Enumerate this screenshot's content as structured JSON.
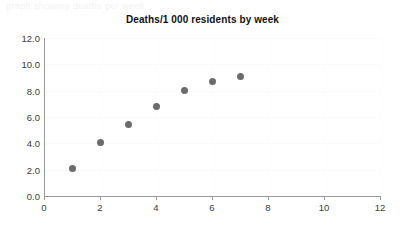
{
  "top_strip": {
    "text": "graph showing deaths per week"
  },
  "chart_data": {
    "type": "scatter",
    "title": "Deaths/1 000 residents by week",
    "xlabel": "",
    "ylabel": "",
    "x": [
      1,
      2,
      3,
      4,
      5,
      6,
      7
    ],
    "values": [
      2.1,
      4.1,
      5.4,
      6.8,
      8.0,
      8.7,
      9.1
    ],
    "series": [
      {
        "name": "Deaths/1 000 residents",
        "x": [
          1,
          2,
          3,
          4,
          5,
          6,
          7
        ],
        "values": [
          2.1,
          4.1,
          5.4,
          6.8,
          8.0,
          8.7,
          9.1
        ]
      }
    ],
    "xlim": [
      0,
      12
    ],
    "ylim": [
      0,
      12
    ],
    "xticks": [
      0,
      2,
      4,
      6,
      8,
      10,
      12
    ],
    "xtick_labels": [
      "0",
      "2",
      "4",
      "6",
      "8",
      "10",
      "12"
    ],
    "yticks": [
      0,
      2,
      4,
      6,
      8,
      10,
      12
    ],
    "ytick_labels": [
      "0.0",
      "2.0",
      "4.0",
      "6.0",
      "8.0",
      "10.0",
      "12.0"
    ],
    "grid": true,
    "legend": false,
    "marker_color": "#6b6b6b",
    "axis_color": "#9a9a9a",
    "grid_color": "#fbfbfb",
    "background": "#ffffff"
  }
}
